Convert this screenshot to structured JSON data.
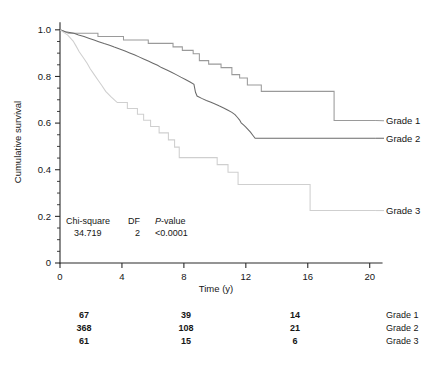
{
  "chart_data": {
    "type": "line",
    "title": "",
    "xlabel": "Time (y)",
    "ylabel": "Cumulative survival",
    "xlim": [
      0,
      20.6
    ],
    "ylim": [
      0,
      1.04
    ],
    "grid": false,
    "legend_position": "right-inline",
    "xticks": [
      0,
      4,
      8,
      12,
      16,
      20
    ],
    "xtick_labels": [
      "0",
      "4",
      "8",
      "12",
      "16",
      "20"
    ],
    "x_minor_step": 1,
    "yticks": [
      0,
      0.2,
      0.4,
      0.6,
      0.8,
      1.0
    ],
    "ytick_labels": [
      "0",
      "0.2",
      "0.4",
      "0.6",
      "0.8",
      "1.0"
    ],
    "y_minor_step": 0.05,
    "series": [
      {
        "name": "Grade 1",
        "color": "#9a9a9a",
        "label_y": 0.61,
        "steps": [
          [
            0.0,
            1.0
          ],
          [
            0.55,
            0.985
          ],
          [
            2.45,
            0.985
          ],
          [
            2.45,
            0.971
          ],
          [
            4.1,
            0.971
          ],
          [
            4.1,
            0.956
          ],
          [
            5.7,
            0.956
          ],
          [
            5.7,
            0.942
          ],
          [
            7.3,
            0.942
          ],
          [
            7.3,
            0.927
          ],
          [
            7.9,
            0.927
          ],
          [
            7.9,
            0.912
          ],
          [
            8.6,
            0.912
          ],
          [
            8.6,
            0.897
          ],
          [
            9.0,
            0.897
          ],
          [
            9.0,
            0.868
          ],
          [
            9.6,
            0.868
          ],
          [
            9.6,
            0.853
          ],
          [
            10.4,
            0.853
          ],
          [
            10.4,
            0.838
          ],
          [
            11.1,
            0.838
          ],
          [
            11.1,
            0.808
          ],
          [
            11.6,
            0.808
          ],
          [
            11.6,
            0.793
          ],
          [
            12.1,
            0.793
          ],
          [
            12.1,
            0.763
          ],
          [
            13.0,
            0.763
          ],
          [
            13.0,
            0.736
          ],
          [
            17.7,
            0.736
          ],
          [
            17.7,
            0.611
          ],
          [
            20.4,
            0.611
          ]
        ]
      },
      {
        "name": "Grade 2",
        "color": "#6b6b6b",
        "label_y": 0.535,
        "steps": [
          [
            0.0,
            1.0
          ],
          [
            0.35,
            0.992
          ],
          [
            0.9,
            0.985
          ],
          [
            1.2,
            0.978
          ],
          [
            1.55,
            0.971
          ],
          [
            1.9,
            0.963
          ],
          [
            2.2,
            0.956
          ],
          [
            2.5,
            0.949
          ],
          [
            2.85,
            0.941
          ],
          [
            3.2,
            0.934
          ],
          [
            3.5,
            0.926
          ],
          [
            3.85,
            0.918
          ],
          [
            4.2,
            0.909
          ],
          [
            4.5,
            0.901
          ],
          [
            4.8,
            0.893
          ],
          [
            5.1,
            0.884
          ],
          [
            5.4,
            0.875
          ],
          [
            5.7,
            0.866
          ],
          [
            6.0,
            0.857
          ],
          [
            6.3,
            0.848
          ],
          [
            6.55,
            0.838
          ],
          [
            6.9,
            0.828
          ],
          [
            7.2,
            0.818
          ],
          [
            7.5,
            0.808
          ],
          [
            7.8,
            0.797
          ],
          [
            8.1,
            0.787
          ],
          [
            8.4,
            0.776
          ],
          [
            8.65,
            0.766
          ],
          [
            8.75,
            0.732
          ],
          [
            8.85,
            0.716
          ],
          [
            9.15,
            0.706
          ],
          [
            9.45,
            0.697
          ],
          [
            9.75,
            0.689
          ],
          [
            10.05,
            0.681
          ],
          [
            10.3,
            0.673
          ],
          [
            10.6,
            0.664
          ],
          [
            10.85,
            0.655
          ],
          [
            11.1,
            0.646
          ],
          [
            11.3,
            0.636
          ],
          [
            11.45,
            0.625
          ],
          [
            11.6,
            0.613
          ],
          [
            11.7,
            0.601
          ],
          [
            11.85,
            0.592
          ],
          [
            12.0,
            0.583
          ],
          [
            12.15,
            0.572
          ],
          [
            12.3,
            0.561
          ],
          [
            12.45,
            0.548
          ],
          [
            12.6,
            0.535
          ],
          [
            20.4,
            0.535
          ]
        ]
      },
      {
        "name": "Grade 3",
        "color": "#cfcfcf",
        "label_y": 0.225,
        "steps": [
          [
            0.0,
            1.0
          ],
          [
            0.5,
            0.977
          ],
          [
            0.85,
            0.952
          ],
          [
            1.05,
            0.929
          ],
          [
            1.25,
            0.905
          ],
          [
            1.5,
            0.881
          ],
          [
            1.75,
            0.857
          ],
          [
            1.95,
            0.833
          ],
          [
            2.2,
            0.809
          ],
          [
            2.45,
            0.785
          ],
          [
            2.7,
            0.761
          ],
          [
            2.95,
            0.736
          ],
          [
            3.3,
            0.712
          ],
          [
            3.7,
            0.688
          ],
          [
            4.35,
            0.688
          ],
          [
            4.35,
            0.663
          ],
          [
            5.0,
            0.663
          ],
          [
            5.0,
            0.638
          ],
          [
            5.4,
            0.638
          ],
          [
            5.4,
            0.612
          ],
          [
            5.85,
            0.612
          ],
          [
            5.85,
            0.585
          ],
          [
            6.4,
            0.585
          ],
          [
            6.4,
            0.558
          ],
          [
            7.0,
            0.558
          ],
          [
            7.0,
            0.528
          ],
          [
            7.4,
            0.528
          ],
          [
            7.4,
            0.497
          ],
          [
            7.7,
            0.497
          ],
          [
            7.7,
            0.452
          ],
          [
            10.15,
            0.452
          ],
          [
            10.15,
            0.422
          ],
          [
            10.85,
            0.422
          ],
          [
            10.85,
            0.389
          ],
          [
            11.5,
            0.389
          ],
          [
            11.5,
            0.337
          ],
          [
            16.15,
            0.337
          ],
          [
            16.15,
            0.225
          ],
          [
            20.4,
            0.225
          ]
        ]
      }
    ],
    "annotations": {
      "stats": {
        "headers": [
          "Chi-square",
          "DF",
          "P-value"
        ],
        "p_value_prefix": "P",
        "p_value_suffix": "-value",
        "values": [
          "34.719",
          "2",
          "<0.0001"
        ]
      },
      "risk_table": {
        "time_points": [
          0,
          8,
          14
        ],
        "rows": [
          {
            "label": "Grade 1",
            "counts": [
              "67",
              "39",
              "14"
            ]
          },
          {
            "label": "Grade 2",
            "counts": [
              "368",
              "108",
              "21"
            ]
          },
          {
            "label": "Grade 3",
            "counts": [
              "61",
              "15",
              "6"
            ]
          }
        ]
      }
    }
  }
}
